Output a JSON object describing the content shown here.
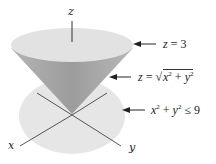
{
  "figure": {
    "type": "3d-region-diagram",
    "axes": {
      "z_label": "z",
      "x_label": "x",
      "y_label": "y"
    },
    "annotations": [
      {
        "target": "top-plane",
        "label": "z = 3"
      },
      {
        "target": "cone-surface",
        "label": "z = √(x² + y²)"
      },
      {
        "target": "base-disk",
        "label": "x² + y² ≤ 9"
      }
    ],
    "colors": {
      "top_disk": "#e0e0e0",
      "cone_dark": "#9a9a9a",
      "cone_light": "#c4c4c4",
      "base_disk": "#e8e8e8",
      "axis_line": "#333333",
      "arrow": "#222222"
    }
  }
}
